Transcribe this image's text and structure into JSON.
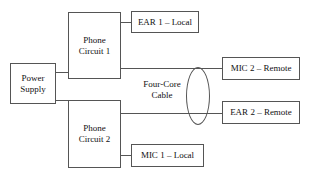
{
  "diagram": {
    "nodes": {
      "power_supply": "Power\nSupply",
      "phone_circuit_1": "Phone\nCircuit 1",
      "phone_circuit_2": "Phone\nCircuit 2",
      "ear_1_local": "EAR 1 – Local",
      "mic_1_local": "MIC 1 –  Local",
      "mic_2_remote": "MIC 2 – Remote",
      "ear_2_remote": "EAR 2 – Remote"
    },
    "labels": {
      "four_core_cable": "Four-Core\nCable"
    },
    "colors": {
      "stroke": "#555555",
      "text": "#111111",
      "background": "#ffffff"
    }
  }
}
